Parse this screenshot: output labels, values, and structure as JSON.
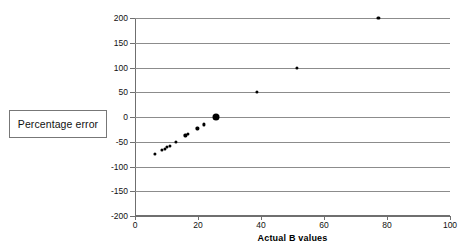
{
  "figure": {
    "y_axis_title_box": "Percentage error",
    "x_axis_title": "Actual B values"
  },
  "chart_data": {
    "type": "scatter",
    "title": "",
    "xlabel": "Actual B values",
    "ylabel": "Percentage error",
    "xlim": [
      0,
      100
    ],
    "ylim": [
      -200,
      200
    ],
    "xticks": [
      "0",
      "20",
      "40",
      "60",
      "80",
      "100"
    ],
    "xtick_values": [
      0,
      20,
      40,
      60,
      80,
      100
    ],
    "yticks": [
      "200",
      "150",
      "100",
      "50",
      "0",
      "-50",
      "-100",
      "-150",
      "-200"
    ],
    "ytick_values": [
      200,
      150,
      100,
      50,
      0,
      -50,
      -100,
      -150,
      -200
    ],
    "grid": "horizontal",
    "legend": "none",
    "marker_color": "#000000",
    "gridline_color": "#8c8c8c",
    "axis_color": "#6f6f6f",
    "series": [
      {
        "name": "Percentage error",
        "points": [
          {
            "x": 6.3,
            "y": -75,
            "size": 3.2
          },
          {
            "x": 8.6,
            "y": -66,
            "size": 3.2
          },
          {
            "x": 9.4,
            "y": -64,
            "size": 3.2
          },
          {
            "x": 10.2,
            "y": -61,
            "size": 3.2
          },
          {
            "x": 11.0,
            "y": -58,
            "size": 3.2
          },
          {
            "x": 13.0,
            "y": -50,
            "size": 3.2
          },
          {
            "x": 16.0,
            "y": -37,
            "size": 3.2
          },
          {
            "x": 16.8,
            "y": -34,
            "size": 3.2
          },
          {
            "x": 19.8,
            "y": -23,
            "size": 3.2
          },
          {
            "x": 21.8,
            "y": -15,
            "size": 3.2
          },
          {
            "x": 25.8,
            "y": 0,
            "size": 7.0
          },
          {
            "x": 38.6,
            "y": 50,
            "size": 3.2
          },
          {
            "x": 51.3,
            "y": 100,
            "size": 3.2
          },
          {
            "x": 77.3,
            "y": 200,
            "size": 3.2
          }
        ]
      }
    ]
  }
}
